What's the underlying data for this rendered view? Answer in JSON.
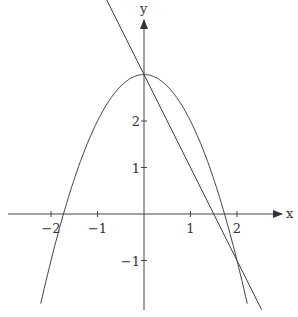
{
  "chart_data": {
    "type": "line",
    "title": "",
    "xlabel": "x",
    "ylabel": "y",
    "xlim": [
      -3.1,
      3.0
    ],
    "ylim": [
      -2.1,
      4.2
    ],
    "x_ticks": [
      -2,
      -1,
      1,
      2
    ],
    "y_ticks": [
      -1,
      1,
      2
    ],
    "x_tick_labels": [
      "-2",
      "-1",
      "1",
      "2"
    ],
    "y_tick_labels": [
      "-1",
      "1",
      "2"
    ],
    "grid": false,
    "series": [
      {
        "name": "parabola",
        "equation": "y = 3 - x^2",
        "x_range": [
          -2.22,
          2.22
        ]
      },
      {
        "name": "line",
        "equation": "y = 3 - 2x",
        "x_range": [
          -0.82,
          2.53
        ]
      }
    ],
    "intersections": [
      [
        0,
        3
      ],
      [
        2,
        -1
      ]
    ],
    "origin_px": [
      144,
      214
    ],
    "px_per_unit": 46.5
  },
  "labels": {
    "x_axis": "x",
    "y_axis": "y"
  }
}
